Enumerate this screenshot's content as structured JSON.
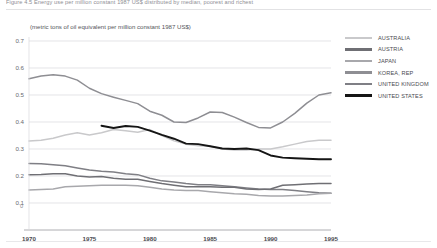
{
  "figure": {
    "caption_top": "Figure 4.5  Energy use per million constant 1987 US$ distributed by median, poorest and richest",
    "subtitle": "(metric tons of oil equivalent per million constant 1987 US$)"
  },
  "legend": {
    "position": "right",
    "entries": [
      {
        "label": "AUSTRALIA",
        "color": "#c9c9cb"
      },
      {
        "label": "AUSTRIA",
        "color": "#6f6f74"
      },
      {
        "label": "JAPAN",
        "color": "#a8a8ac"
      },
      {
        "label": "KOREA, REP",
        "color": "#8e8e93"
      },
      {
        "label": "UNITED KINGDOM",
        "color": "#7f7f85"
      },
      {
        "label": "UNITED STATES",
        "color": "#151515"
      }
    ]
  },
  "axes": {
    "y_ticks": [
      "0.7",
      "0.6",
      "0.5",
      "0.4",
      "0.3",
      "0.2",
      "0.1"
    ],
    "y_zero_label": "0",
    "x_ticks": [
      "1970",
      "1975",
      "1980",
      "1985",
      "1990",
      "1995"
    ],
    "ylim": [
      0,
      0.7
    ],
    "xlim": [
      1970,
      1995
    ],
    "grid": true
  },
  "chart_data": {
    "type": "line",
    "title": "Figure 4.5  Energy use per million constant 1987 US$ distributed by median, poorest and richest",
    "subtitle": "(metric tons of oil equivalent per million constant 1987 US$)",
    "xlabel": "",
    "ylabel": "(metric tons of oil equivalent per million constant 1987 US$)",
    "xlim": [
      1970,
      1995
    ],
    "ylim": [
      0,
      0.7
    ],
    "grid": true,
    "legend_position": "right",
    "x": [
      1970,
      1971,
      1972,
      1973,
      1974,
      1975,
      1976,
      1977,
      1978,
      1979,
      1980,
      1981,
      1982,
      1983,
      1984,
      1985,
      1986,
      1987,
      1988,
      1989,
      1990,
      1991,
      1992,
      1993,
      1994,
      1995
    ],
    "series": [
      {
        "name": "KOREA, REP",
        "color": "#8e8e93",
        "values": [
          0.56,
          0.57,
          0.575,
          0.57,
          0.555,
          0.525,
          0.505,
          0.492,
          0.48,
          0.468,
          0.44,
          0.425,
          0.4,
          0.398,
          0.415,
          0.437,
          0.435,
          0.418,
          0.398,
          0.38,
          0.378,
          0.4,
          0.432,
          0.47,
          0.5,
          0.508
        ]
      },
      {
        "name": "AUSTRALIA",
        "color": "#c9c9cb",
        "values": [
          0.33,
          0.332,
          0.34,
          0.352,
          0.36,
          0.352,
          0.36,
          0.372,
          0.368,
          0.362,
          0.372,
          0.35,
          0.33,
          0.318,
          0.312,
          0.31,
          0.3,
          0.296,
          0.296,
          0.3,
          0.3,
          0.308,
          0.318,
          0.328,
          0.332,
          0.332
        ]
      },
      {
        "name": "UNITED STATES",
        "color": "#151515",
        "values": [
          null,
          null,
          null,
          null,
          null,
          null,
          0.386,
          0.378,
          0.385,
          0.382,
          0.368,
          0.352,
          0.338,
          0.32,
          0.318,
          0.31,
          0.302,
          0.3,
          0.302,
          0.296,
          0.276,
          0.268,
          0.266,
          0.264,
          0.262,
          0.262
        ]
      },
      {
        "name": "UNITED KINGDOM",
        "color": "#7f7f85",
        "values": [
          0.246,
          0.245,
          0.242,
          0.238,
          0.23,
          0.222,
          0.218,
          0.215,
          0.208,
          0.205,
          0.192,
          0.182,
          0.178,
          0.172,
          0.168,
          0.168,
          0.164,
          0.16,
          0.156,
          0.152,
          0.15,
          0.15,
          0.146,
          0.142,
          0.138,
          0.136
        ]
      },
      {
        "name": "AUSTRIA",
        "color": "#6f6f74",
        "values": [
          0.205,
          0.206,
          0.208,
          0.208,
          0.2,
          0.196,
          0.198,
          0.192,
          0.188,
          0.188,
          0.18,
          0.172,
          0.166,
          0.16,
          0.16,
          0.16,
          0.158,
          0.158,
          0.152,
          0.15,
          0.152,
          0.166,
          0.168,
          0.17,
          0.172,
          0.172
        ]
      },
      {
        "name": "JAPAN",
        "color": "#a8a8ac",
        "values": [
          0.148,
          0.15,
          0.152,
          0.16,
          0.162,
          0.164,
          0.166,
          0.166,
          0.166,
          0.164,
          0.158,
          0.152,
          0.148,
          0.146,
          0.146,
          0.142,
          0.138,
          0.134,
          0.132,
          0.128,
          0.126,
          0.126,
          0.128,
          0.13,
          0.134,
          0.136
        ]
      }
    ]
  }
}
